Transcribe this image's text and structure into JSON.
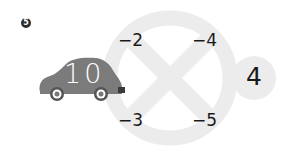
{
  "problem": {
    "number": "5",
    "start_value": "10",
    "operations": [
      {
        "position": "top-left",
        "label": "−2"
      },
      {
        "position": "top-right",
        "label": "−4"
      },
      {
        "position": "bottom-left",
        "label": "−3"
      },
      {
        "position": "bottom-right",
        "label": "−5"
      }
    ],
    "result": "4"
  },
  "colors": {
    "ring": "#ececec",
    "car_body": "#7b7b7b",
    "car_wheel": "#555555",
    "badge": "#2b2b2b",
    "text": "#1a1a1a"
  }
}
